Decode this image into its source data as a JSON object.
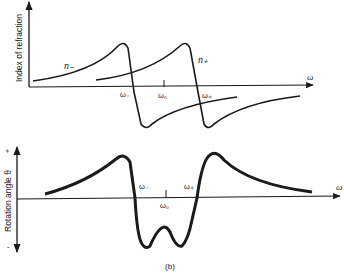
{
  "figure": {
    "caption": "(b)",
    "top_panel": {
      "y_axis_label": "Index of refraction",
      "x_axis_label": "ω",
      "curve_labels": {
        "n_minus": "n₋",
        "n_plus": "n₊"
      },
      "tick_labels": {
        "omega_minus": "ω₋",
        "omega_zero": "ω₀",
        "omega_plus": "ω₊"
      }
    },
    "bottom_panel": {
      "y_axis_label": "Rotation angle θ",
      "y_axis_plus": "+",
      "y_axis_minus": "-",
      "x_axis_label": "ω",
      "tick_labels": {
        "omega_minus": "ω₋",
        "omega_zero": "ω₀",
        "omega_plus": "ω₊"
      }
    },
    "colors": {
      "ink": "#1a1a1a",
      "background": "#ffffff"
    }
  }
}
